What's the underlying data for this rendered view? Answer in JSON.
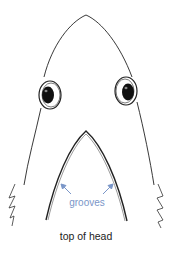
{
  "diagram": {
    "labels": {
      "grooves": "grooves",
      "caption": "top of head"
    },
    "colors": {
      "outline": "#222222",
      "annotation": "#7a96c8",
      "eye_pupil": "#111111"
    },
    "parts": [
      "snout-outline",
      "left-eye",
      "right-eye",
      "left-gill-slits",
      "right-gill-slits",
      "groove-arch",
      "groove-arrows"
    ]
  }
}
